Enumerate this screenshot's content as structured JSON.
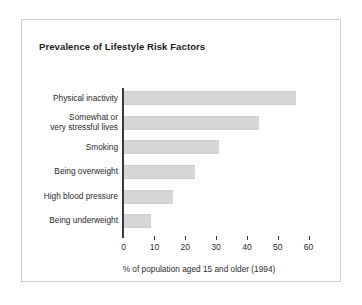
{
  "figure": {
    "title": "Prevalence of Lifestyle Risk Factors"
  },
  "chart_data": {
    "type": "bar",
    "orientation": "horizontal",
    "title": "Prevalence of Lifestyle Risk Factors",
    "xlabel": "% of population aged 15 and older (1994)",
    "ylabel": "",
    "categories": [
      "Physical inactivity",
      "Somewhat or\nvery stressful lives",
      "Smoking",
      "Being overweight",
      "High blood pressure",
      "Being underweight"
    ],
    "values": [
      56,
      44,
      31,
      23,
      16,
      9
    ],
    "xlim": [
      0,
      60
    ],
    "xticks": [
      0,
      10,
      20,
      30,
      40,
      50,
      60
    ],
    "xtick_labels": [
      "0",
      "10",
      "20",
      "30",
      "40",
      "50",
      "60"
    ],
    "grid": false,
    "legend": "none",
    "bar_color": "#d6d6d6",
    "axis_color": "#3a3a3a",
    "frame_color": "#cfcfcf",
    "background": "#ffffff"
  }
}
